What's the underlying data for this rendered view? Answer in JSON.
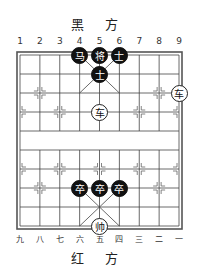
{
  "top_label": "黑 方",
  "bottom_label": "红 方",
  "top_numbers": [
    "1",
    "2",
    "3",
    "4",
    "5",
    "6",
    "7",
    "8",
    "9"
  ],
  "bottom_numbers": [
    "九",
    "八",
    "七",
    "六",
    "五",
    "四",
    "三",
    "二",
    "一"
  ],
  "pieces": [
    {
      "side": "black",
      "char": "马",
      "col": 4,
      "row": 0
    },
    {
      "side": "black",
      "char": "将",
      "col": 5,
      "row": 0
    },
    {
      "side": "black",
      "char": "士",
      "col": 6,
      "row": 0
    },
    {
      "side": "black",
      "char": "士",
      "col": 5,
      "row": 1
    },
    {
      "side": "red",
      "char": "车",
      "col": 9,
      "row": 2
    },
    {
      "side": "red",
      "char": "车",
      "col": 5,
      "row": 3
    },
    {
      "side": "black",
      "char": "卒",
      "col": 4,
      "row": 7
    },
    {
      "side": "black",
      "char": "卒",
      "col": 5,
      "row": 7
    },
    {
      "side": "black",
      "char": "卒",
      "col": 6,
      "row": 7
    },
    {
      "side": "red",
      "char": "帅",
      "col": 5,
      "row": 9
    }
  ]
}
